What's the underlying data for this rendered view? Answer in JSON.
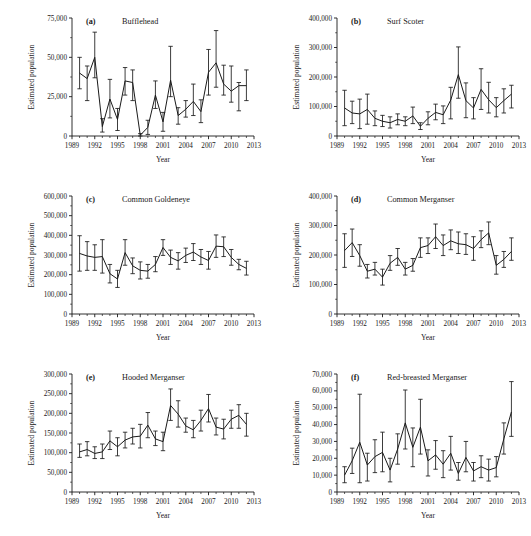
{
  "figure": {
    "axis_titles": {
      "x": "Year",
      "y": "Estimated population"
    },
    "x_tick_labels": [
      "1989",
      "1992",
      "1995",
      "1998",
      "2001",
      "2004",
      "2007",
      "2010",
      "2013"
    ],
    "x_tick_values": [
      1989,
      1992,
      1995,
      1998,
      2001,
      2004,
      2007,
      2010,
      2013
    ],
    "x_range": [
      1989,
      2013
    ]
  },
  "chart_data": [
    {
      "type": "line",
      "panel": "a",
      "letter": "(a)",
      "title": "Bufflehead",
      "xlabel": "Year",
      "ylabel": "Estimated population",
      "xlim": [
        1989,
        2013
      ],
      "ylim": [
        0,
        75000
      ],
      "y_ticks": [
        0,
        25000,
        50000,
        75000
      ],
      "y_tick_labels": [
        "0",
        "25,000",
        "50,000",
        "75,000"
      ],
      "grid": false,
      "legend": "none",
      "x": [
        1990,
        1991,
        1992,
        1993,
        1994,
        1995,
        1996,
        1997,
        1998,
        1999,
        2000,
        2001,
        2002,
        2003,
        2004,
        2005,
        2006,
        2007,
        2008,
        2009,
        2010,
        2011,
        2012
      ],
      "values": [
        40000,
        36500,
        50000,
        6000,
        23500,
        10500,
        35000,
        34000,
        500,
        5500,
        26000,
        9000,
        35500,
        13000,
        17000,
        22000,
        15500,
        40500,
        46500,
        33000,
        28500,
        32000,
        32000
      ],
      "err_low": [
        30000,
        22500,
        37000,
        2500,
        11500,
        3500,
        26000,
        22500,
        0,
        1000,
        17500,
        3000,
        25000,
        7500,
        12000,
        13000,
        8500,
        26000,
        31000,
        26000,
        21500,
        16000,
        22500
      ],
      "err_high": [
        50000,
        44500,
        66000,
        11000,
        36000,
        17500,
        43500,
        42000,
        1500,
        10000,
        35000,
        15000,
        57000,
        18000,
        22500,
        33000,
        23000,
        55000,
        67000,
        45000,
        44500,
        34000,
        42000
      ]
    },
    {
      "type": "line",
      "panel": "b",
      "letter": "(b)",
      "title": "Surf Scoter",
      "xlabel": "Year",
      "ylabel": "Estimated population",
      "xlim": [
        1989,
        2013
      ],
      "ylim": [
        0,
        400000
      ],
      "y_ticks": [
        0,
        100000,
        200000,
        300000,
        400000
      ],
      "y_tick_labels": [
        "0",
        "100,000",
        "200,000",
        "300,000",
        "400,000"
      ],
      "grid": false,
      "legend": "none",
      "x": [
        1990,
        1991,
        1992,
        1993,
        1994,
        1995,
        1996,
        1997,
        1998,
        1999,
        2000,
        2001,
        2002,
        2003,
        2004,
        2005,
        2006,
        2007,
        2008,
        2009,
        2010,
        2011,
        2012
      ],
      "values": [
        95000,
        78000,
        75000,
        90000,
        60000,
        50000,
        45000,
        56000,
        50000,
        68000,
        33000,
        60000,
        80000,
        72000,
        122000,
        208000,
        120000,
        95000,
        158000,
        123000,
        96000,
        120000,
        142000
      ],
      "err_low": [
        35000,
        42000,
        25000,
        40000,
        35000,
        32000,
        27000,
        38000,
        35000,
        42000,
        22000,
        38000,
        55000,
        42000,
        58000,
        128000,
        62000,
        58000,
        90000,
        78000,
        65000,
        78000,
        95000
      ],
      "err_high": [
        155000,
        118000,
        125000,
        142000,
        85000,
        70000,
        65000,
        75000,
        65000,
        98000,
        45000,
        82000,
        108000,
        102000,
        165000,
        302000,
        180000,
        130000,
        228000,
        182000,
        130000,
        160000,
        172000
      ]
    },
    {
      "type": "line",
      "panel": "c",
      "letter": "(c)",
      "title": "Common Goldeneye",
      "xlabel": "Year",
      "ylabel": "Estimated population",
      "xlim": [
        1989,
        2013
      ],
      "ylim": [
        0,
        600000
      ],
      "y_ticks": [
        0,
        100000,
        200000,
        300000,
        400000,
        500000,
        600000
      ],
      "y_tick_labels": [
        "0",
        "100,000",
        "200,000",
        "300,000",
        "400,000",
        "500,000",
        "600,000"
      ],
      "grid": false,
      "legend": "none",
      "x": [
        1990,
        1991,
        1992,
        1993,
        1994,
        1995,
        1996,
        1997,
        1998,
        1999,
        2000,
        2001,
        2002,
        2003,
        2004,
        2005,
        2006,
        2007,
        2008,
        2009,
        2010,
        2011,
        2012
      ],
      "values": [
        308000,
        295000,
        288000,
        292000,
        205000,
        178000,
        312000,
        245000,
        222000,
        218000,
        252000,
        338000,
        288000,
        270000,
        298000,
        315000,
        290000,
        272000,
        345000,
        342000,
        288000,
        252000,
        232000
      ],
      "err_low": [
        218000,
        222000,
        222000,
        208000,
        158000,
        135000,
        248000,
        205000,
        178000,
        182000,
        215000,
        298000,
        252000,
        228000,
        262000,
        272000,
        252000,
        228000,
        288000,
        292000,
        248000,
        225000,
        198000
      ],
      "err_high": [
        398000,
        368000,
        352000,
        378000,
        252000,
        222000,
        378000,
        285000,
        265000,
        252000,
        292000,
        378000,
        325000,
        312000,
        335000,
        358000,
        328000,
        318000,
        402000,
        392000,
        328000,
        278000,
        268000
      ]
    },
    {
      "type": "line",
      "panel": "d",
      "letter": "(d)",
      "title": "Common Merganser",
      "xlabel": "Year",
      "ylabel": "Estimated population",
      "xlim": [
        1989,
        2013
      ],
      "ylim": [
        0,
        400000
      ],
      "y_ticks": [
        0,
        100000,
        200000,
        300000,
        400000
      ],
      "y_tick_labels": [
        "0",
        "100,000",
        "200,000",
        "300,000",
        "400,000"
      ],
      "grid": false,
      "legend": "none",
      "x": [
        1990,
        1991,
        1992,
        1993,
        1994,
        1995,
        1996,
        1997,
        1998,
        1999,
        2000,
        2001,
        2002,
        2003,
        2004,
        2005,
        2006,
        2007,
        2008,
        2009,
        2010,
        2011,
        2012
      ],
      "values": [
        215000,
        242000,
        198000,
        145000,
        152000,
        125000,
        172000,
        192000,
        152000,
        165000,
        225000,
        232000,
        262000,
        232000,
        248000,
        238000,
        235000,
        222000,
        252000,
        275000,
        165000,
        185000,
        212000
      ],
      "err_low": [
        158000,
        195000,
        162000,
        122000,
        132000,
        98000,
        148000,
        165000,
        132000,
        145000,
        192000,
        205000,
        222000,
        198000,
        218000,
        205000,
        202000,
        182000,
        225000,
        235000,
        135000,
        158000,
        182000
      ],
      "err_high": [
        272000,
        288000,
        235000,
        168000,
        175000,
        152000,
        198000,
        222000,
        175000,
        188000,
        258000,
        258000,
        305000,
        268000,
        285000,
        278000,
        272000,
        262000,
        282000,
        312000,
        198000,
        212000,
        258000
      ]
    },
    {
      "type": "line",
      "panel": "e",
      "letter": "(e)",
      "title": "Hooded Merganser",
      "xlabel": "Year",
      "ylabel": "Estimated population",
      "xlim": [
        1989,
        2013
      ],
      "ylim": [
        0,
        300000
      ],
      "y_ticks": [
        0,
        50000,
        100000,
        150000,
        200000,
        250000,
        300000
      ],
      "y_tick_labels": [
        "0",
        "50,000",
        "100,000",
        "150,000",
        "200,000",
        "250,000",
        "300,000"
      ],
      "grid": false,
      "legend": "none",
      "x": [
        1990,
        1991,
        1992,
        1993,
        1994,
        1995,
        1996,
        1997,
        1998,
        1999,
        2000,
        2001,
        2002,
        2003,
        2004,
        2005,
        2006,
        2007,
        2008,
        2009,
        2010,
        2011,
        2012
      ],
      "values": [
        102000,
        108000,
        98000,
        102000,
        130000,
        115000,
        132000,
        140000,
        142000,
        170000,
        135000,
        128000,
        220000,
        198000,
        168000,
        158000,
        182000,
        212000,
        165000,
        160000,
        185000,
        195000,
        172000
      ],
      "err_low": [
        88000,
        92000,
        85000,
        85000,
        108000,
        92000,
        112000,
        122000,
        112000,
        138000,
        118000,
        105000,
        182000,
        165000,
        152000,
        138000,
        155000,
        178000,
        145000,
        135000,
        162000,
        162000,
        142000
      ],
      "err_high": [
        122000,
        128000,
        115000,
        122000,
        155000,
        138000,
        152000,
        162000,
        172000,
        202000,
        155000,
        152000,
        262000,
        232000,
        188000,
        182000,
        208000,
        248000,
        188000,
        185000,
        208000,
        222000,
        200000
      ]
    },
    {
      "type": "line",
      "panel": "f",
      "letter": "(f)",
      "title": "Red-breasted Merganser",
      "xlabel": "Year",
      "ylabel": "Estimated population",
      "xlim": [
        1989,
        2013
      ],
      "ylim": [
        0,
        70000
      ],
      "y_ticks": [
        0,
        10000,
        20000,
        30000,
        40000,
        50000,
        60000,
        70000
      ],
      "y_tick_labels": [
        "0",
        "10,000",
        "20,000",
        "30,000",
        "40,000",
        "50,000",
        "60,000",
        "70,000"
      ],
      "grid": false,
      "legend": "none",
      "x": [
        1990,
        1991,
        1992,
        1993,
        1994,
        1995,
        1996,
        1997,
        1998,
        1999,
        2000,
        2001,
        2002,
        2003,
        2004,
        2005,
        2006,
        2007,
        2008,
        2009,
        2010,
        2011,
        2012
      ],
      "values": [
        10000,
        18500,
        29500,
        16000,
        21000,
        23500,
        13000,
        25500,
        41000,
        26500,
        38500,
        18500,
        22000,
        16500,
        23000,
        11000,
        20500,
        12500,
        15000,
        13000,
        14500,
        31500,
        47500
      ],
      "err_low": [
        5500,
        11000,
        5500,
        6500,
        11500,
        12000,
        6000,
        16500,
        25500,
        15000,
        22500,
        9500,
        13500,
        8500,
        13000,
        7000,
        12000,
        6500,
        8500,
        6500,
        9000,
        22500,
        33000
      ],
      "err_high": [
        15000,
        26000,
        58000,
        23000,
        31000,
        35500,
        20000,
        34500,
        60500,
        38000,
        55000,
        25000,
        30500,
        24500,
        33000,
        17500,
        30000,
        17500,
        21500,
        19500,
        21000,
        41000,
        65500
      ]
    }
  ]
}
